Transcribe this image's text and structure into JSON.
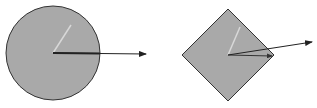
{
  "diagram": {
    "background": "#ffffff",
    "shape_fill": "#a9a9a9",
    "shape_stroke": "#333333",
    "arrow_dark": "#222222",
    "arrow_light": "#d8d8d8",
    "shapes": [
      {
        "type": "circle",
        "center": [
          53,
          53
        ],
        "radius": 47,
        "arrows": [
          {
            "kind": "light",
            "from": [
              53,
              53
            ],
            "to": [
              71,
              25
            ],
            "head": false
          },
          {
            "kind": "dark",
            "from": [
              53,
              53
            ],
            "to": [
              146,
              54
            ],
            "head": true
          },
          {
            "kind": "dark-thick",
            "from": [
              53,
              53
            ],
            "to": [
              100,
              53.5
            ],
            "head": false
          }
        ]
      },
      {
        "type": "diamond",
        "center": [
          228,
          55
        ],
        "half_size": 46,
        "arrows": [
          {
            "kind": "light",
            "from": [
              228,
              55
            ],
            "to": [
              240,
              27
            ],
            "head": false
          },
          {
            "kind": "dark",
            "from": [
              228,
              55
            ],
            "to": [
              312,
              42
            ],
            "head": true
          },
          {
            "kind": "dark",
            "from": [
              228,
              55
            ],
            "to": [
              272,
              56
            ],
            "head": true
          }
        ]
      }
    ]
  }
}
